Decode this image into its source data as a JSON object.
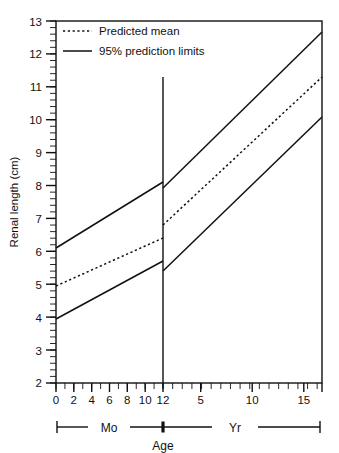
{
  "chart_data": {
    "type": "line",
    "title": "",
    "subtitle": "",
    "xlabel": "Age",
    "ylabel": "Renal length (cm)",
    "ylim": [
      2,
      13
    ],
    "y_ticks": [
      2,
      3,
      4,
      5,
      6,
      7,
      8,
      9,
      10,
      11,
      12,
      13
    ],
    "y_minor_tick_interval": 0.2,
    "grid": false,
    "legend_position": "top-left",
    "x_axis": {
      "label": "Age",
      "segments": [
        {
          "name": "Mo",
          "unit_label": "Mo",
          "range": [
            0,
            12
          ],
          "tick_labels": [
            "0",
            "2",
            "4",
            "6",
            "8",
            "10",
            "12"
          ],
          "tick_values": [
            0,
            2,
            4,
            6,
            8,
            10,
            12
          ],
          "minor_tick_interval": 1
        },
        {
          "name": "Yr",
          "unit_label": "Yr",
          "range": [
            1,
            17.5
          ],
          "tick_labels": [
            "5",
            "10",
            "15"
          ],
          "tick_values": [
            5,
            10,
            15
          ],
          "minor_tick_interval": 1
        }
      ],
      "break_at": "12 months / 1 year"
    },
    "series": [
      {
        "name": "95% prediction limits",
        "sublabel": "upper limit",
        "style": "solid",
        "color": "#000000",
        "segments": [
          {
            "unit": "months",
            "points": [
              [
                0,
                6.05
              ],
              [
                12,
                8.05
              ]
            ]
          },
          {
            "unit": "years",
            "points": [
              [
                1,
                7.85
              ],
              [
                17.5,
                12.6
              ]
            ]
          }
        ]
      },
      {
        "name": "Predicted mean",
        "sublabel": "mean",
        "style": "dotted",
        "color": "#000000",
        "segments": [
          {
            "unit": "months",
            "points": [
              [
                0,
                4.9
              ],
              [
                12,
                6.35
              ]
            ]
          },
          {
            "unit": "years",
            "points": [
              [
                1,
                6.75
              ],
              [
                17.5,
                11.25
              ]
            ]
          }
        ]
      },
      {
        "name": "95% prediction limits",
        "sublabel": "lower limit",
        "style": "solid",
        "color": "#000000",
        "segments": [
          {
            "unit": "months",
            "points": [
              [
                0,
                3.9
              ],
              [
                12,
                5.7
              ]
            ]
          },
          {
            "unit": "years",
            "points": [
              [
                1,
                5.3
              ],
              [
                17.5,
                9.9
              ]
            ]
          }
        ]
      }
    ]
  },
  "legend": {
    "items": [
      {
        "label": "Predicted mean",
        "style": "dotted"
      },
      {
        "label": "95% prediction limits",
        "style": "solid"
      }
    ]
  },
  "axis": {
    "y_title": "Renal length (cm)",
    "y_tick_labels": [
      "13",
      "12",
      "11",
      "10",
      "9",
      "8",
      "7",
      "6",
      "5",
      "4",
      "3",
      "2"
    ],
    "x_tick_labels_months": [
      "0",
      "2",
      "4",
      "6",
      "8",
      "10",
      "12"
    ],
    "x_tick_labels_years": [
      "5",
      "10",
      "15"
    ],
    "x_label": "Age",
    "unit_months": "Mo",
    "unit_years": "Yr"
  },
  "colors": {
    "line": "#111111",
    "frame": "#111111",
    "background": "#ffffff"
  }
}
